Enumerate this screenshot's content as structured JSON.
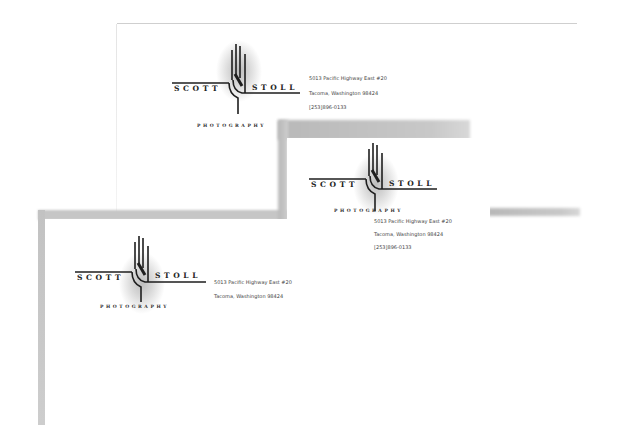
{
  "brand": {
    "first_name": "S C O T T",
    "last_name": "S T O L L",
    "tagline": "P H O T O G R A P H Y"
  },
  "address": {
    "line1": "5013 Pacific Highway East #20",
    "line2": "Tacoma, Washington 98424",
    "phone": "[253]896-0133"
  },
  "items": [
    {
      "type": "letterhead",
      "show_phone": true
    },
    {
      "type": "business-card",
      "show_phone": true
    },
    {
      "type": "envelope-or-second-sheet",
      "show_phone": false
    }
  ],
  "colors": {
    "ink": "#222222",
    "glow": "#bdbdbd",
    "shadow": "#c4c4c4",
    "paper": "#ffffff"
  }
}
